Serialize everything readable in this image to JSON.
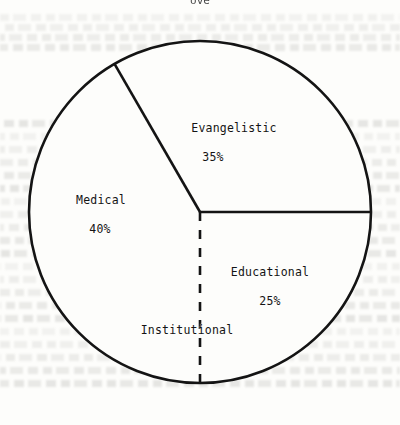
{
  "page": {
    "background": "#fdfdfb",
    "ink": "#141414",
    "title_remnant": "ove",
    "ghost_text_rows": [
      14,
      24,
      34,
      44,
      120,
      133,
      146,
      159,
      172,
      185,
      198,
      211,
      224,
      237,
      250,
      263,
      276,
      289,
      302,
      315,
      328,
      341,
      354,
      367,
      380
    ]
  },
  "chart_data": {
    "type": "pie",
    "title": "",
    "xlabel": "",
    "ylabel": "",
    "legend_position": "inside-slices",
    "grid": false,
    "center": {
      "cx": 200,
      "cy": 212
    },
    "radius": 171,
    "stroke_color": "#141414",
    "stroke_width": 2.6,
    "fill_color": "#fdfdfb",
    "categories": [
      "Evangelistic",
      "Medical",
      "Educational",
      "Institutional"
    ],
    "values": [
      35,
      40,
      25,
      null
    ],
    "value_labels": [
      "35%",
      "40%",
      "25%",
      ""
    ],
    "slices": [
      {
        "name": "Evangelistic",
        "value": 35,
        "value_label": "35%",
        "start_angle_deg": 0,
        "end_angle_deg": 120,
        "divider_style": "solid",
        "label_x": 234,
        "label_y": 128,
        "pct_x": 213,
        "pct_y": 157
      },
      {
        "name": "Medical",
        "value": 40,
        "value_label": "40%",
        "start_angle_deg": 120,
        "end_angle_deg": 270,
        "divider_style": "solid",
        "label_x": 101,
        "label_y": 200,
        "pct_x": 100,
        "pct_y": 229
      },
      {
        "name": "Educational",
        "value": 25,
        "value_label": "25%",
        "start_angle_deg": 270,
        "end_angle_deg": 360,
        "divider_style": "solid",
        "label_x": 270,
        "label_y": 272,
        "pct_x": 270,
        "pct_y": 301
      },
      {
        "name": "Institutional",
        "value": null,
        "value_label": "",
        "divider_style": "dashed",
        "divider_angle_deg": 270,
        "label_x": 187,
        "label_y": 330,
        "pct_x": null,
        "pct_y": null
      }
    ],
    "dividers": [
      {
        "name": "evangelistic-medical-divider",
        "angle_deg": 120,
        "style": "solid"
      },
      {
        "name": "evangelistic-educational-divider",
        "angle_deg": 0,
        "style": "solid"
      },
      {
        "name": "institutional-divider",
        "angle_deg": 270,
        "style": "dashed"
      }
    ]
  }
}
